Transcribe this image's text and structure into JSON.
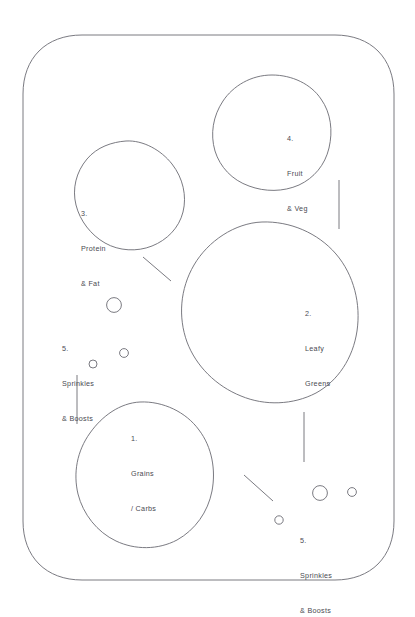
{
  "diagram": {
    "stroke_color": "#6b6b73",
    "text_color": "#4a4a52",
    "background_color": "#ffffff",
    "plate": {
      "name": "plate-outline",
      "shape": "rounded-rectangle"
    },
    "zones": [
      {
        "id": "zone-grains",
        "name": "grains-carbs-zone",
        "number": "1.",
        "line1": "Grains",
        "line2": "/ Carbs",
        "shape": "octagon-blob",
        "label_x": 131,
        "label_y": 410
      },
      {
        "id": "zone-leafy",
        "name": "leafy-greens-zone",
        "number": "2.",
        "line1": "Leafy",
        "line2": "Greens",
        "shape": "large-polygon-blob",
        "label_x": 305,
        "label_y": 285
      },
      {
        "id": "zone-protein",
        "name": "protein-fat-zone",
        "number": "3.",
        "line1": "Protein",
        "line2": "& Fat",
        "shape": "heptagon-blob",
        "label_x": 81,
        "label_y": 185
      },
      {
        "id": "zone-fruit",
        "name": "fruit-veg-zone",
        "number": "4.",
        "line1": "Fruit",
        "line2": "& Veg",
        "shape": "circle-blob",
        "label_x": 287,
        "label_y": 110
      }
    ],
    "sprinkles": [
      {
        "id": "sprinkles-left",
        "name": "sprinkles-boosts-left",
        "number": "5.",
        "line1": "Sprinkles",
        "line2": "& Boosts",
        "label_x": 62,
        "label_y": 320
      },
      {
        "id": "sprinkles-right",
        "name": "sprinkles-boosts-right",
        "number": "5.",
        "line1": "Sprinkles",
        "line2": "& Boosts",
        "label_x": 300,
        "label_y": 512
      }
    ]
  }
}
